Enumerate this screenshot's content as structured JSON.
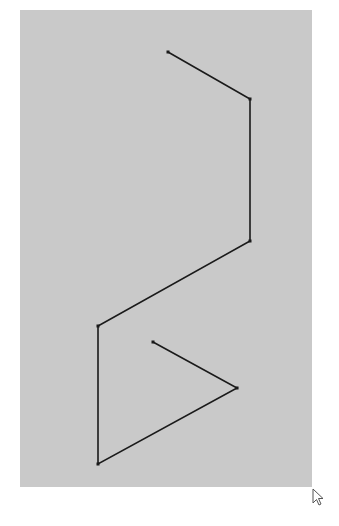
{
  "canvas": {
    "background": "#c9c9c9",
    "bounds": {
      "x": 20,
      "y": 10,
      "width": 292,
      "height": 477
    }
  },
  "polyline": {
    "stroke": "#1a1a1a",
    "stroke_width": 1.6,
    "points": [
      [
        168,
        52
      ],
      [
        250,
        99
      ],
      [
        250,
        241
      ],
      [
        98,
        326
      ],
      [
        98,
        464
      ],
      [
        237,
        388
      ],
      [
        153,
        342
      ]
    ]
  },
  "cursor": {
    "icon": "arrow-pointer-icon",
    "x": 313,
    "y": 489
  }
}
